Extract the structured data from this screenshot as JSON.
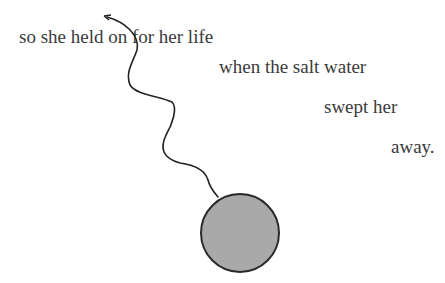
{
  "poem": {
    "lines": [
      "so she held on for her life",
      "when the salt water",
      "swept her",
      "away."
    ]
  },
  "illustration": {
    "balloon_fill": "#a9a9a9",
    "balloon_stroke": "#2a2a2a",
    "string_color": "#222222"
  }
}
